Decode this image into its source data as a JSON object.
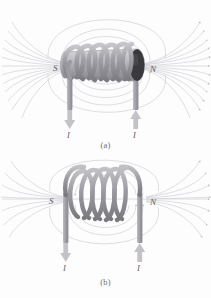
{
  "figure": {
    "background_color": "#fdfdfd",
    "panels": [
      {
        "caption": "(a)",
        "description": "Solenoid wound on a cylindrical core, three-dimensional view",
        "south_pole_label": "S",
        "north_pole_label": "N",
        "current_label_left": "I",
        "current_label_right": "I",
        "left_lead_arrow_direction": "down",
        "right_lead_arrow_direction": "up",
        "coil_turns": 6,
        "has_core_cylinder": true,
        "core_end_cap_color": "#2f2f2f"
      },
      {
        "caption": "(b)",
        "description": "Bare coil of wire without core, three-dimensional view",
        "south_pole_label": "S",
        "north_pole_label": "N",
        "current_label_left": "I",
        "current_label_right": "I",
        "left_lead_arrow_direction": "down",
        "right_lead_arrow_direction": "up",
        "coil_turns": 5,
        "has_core_cylinder": false,
        "core_end_cap_color": "#2f2f2f"
      }
    ],
    "colors": {
      "field_line": "#b9bcc4",
      "coil_wire": "#9a9a9f",
      "coil_wire_dark": "#78787e",
      "lead_wire": "#a3a3a8",
      "core_body": "#b0b0b4",
      "arrow": "#b9b9bd",
      "label_text": "#5d5d5d",
      "caption_text": "#6d6d6d"
    },
    "field_lines": {
      "axis_line_present": true,
      "loop_count_top": 3,
      "loop_count_bottom": 3,
      "fan_line_count_each_side": 11,
      "direction": "from N (right) around to S (left)"
    }
  }
}
